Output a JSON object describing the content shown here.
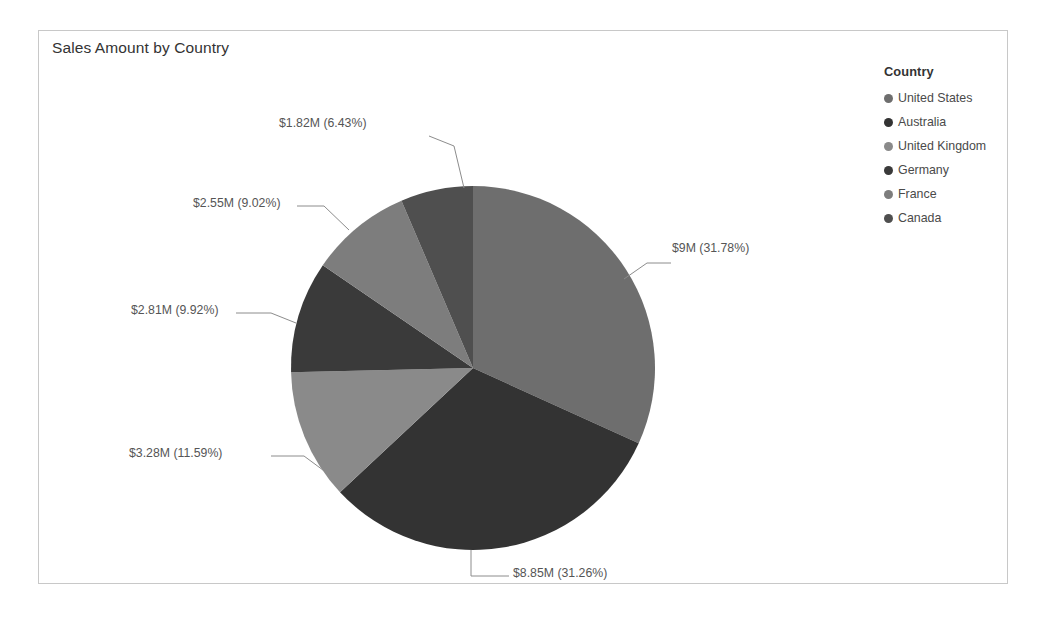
{
  "chart_card": {
    "title": "Sales Amount by Country",
    "border_color": "#c8c8c8",
    "background": "#ffffff"
  },
  "legend": {
    "title": "Country",
    "position": "right",
    "items": [
      {
        "label": "United States",
        "color": "#6e6e6e"
      },
      {
        "label": "Australia",
        "color": "#333333"
      },
      {
        "label": "United Kingdom",
        "color": "#8a8a8a"
      },
      {
        "label": "Germany",
        "color": "#3a3a3a"
      },
      {
        "label": "France",
        "color": "#7d7d7d"
      },
      {
        "label": "Canada",
        "color": "#4f4f4f"
      }
    ]
  },
  "chart_data": {
    "type": "pie",
    "title": "Sales Amount by Country",
    "xlabel": "",
    "ylabel": "",
    "categories": [
      "United States",
      "Australia",
      "United Kingdom",
      "Germany",
      "France",
      "Canada"
    ],
    "values": [
      9.0,
      8.85,
      3.28,
      2.81,
      2.55,
      1.82
    ],
    "value_unit": "millions USD",
    "percentages": [
      31.78,
      31.26,
      11.59,
      9.92,
      9.02,
      6.43
    ],
    "colors": [
      "#6e6e6e",
      "#333333",
      "#8a8a8a",
      "#3a3a3a",
      "#7d7d7d",
      "#4f4f4f"
    ],
    "data_labels": [
      "$9M (31.78%)",
      "$8.85M (31.26%)",
      "$3.28M (11.59%)",
      "$2.81M (9.92%)",
      "$2.55M (9.02%)",
      "$1.82M (6.43%)"
    ],
    "start_angle_deg": 0,
    "direction": "clockwise",
    "legend": [
      "United States",
      "Australia",
      "United Kingdom",
      "Germany",
      "France",
      "Canada"
    ],
    "legend_position": "right",
    "grid": false
  },
  "labels": {
    "united_states": "$9M (31.78%)",
    "australia": "$8.85M (31.26%)",
    "united_kingdom": "$3.28M (11.59%)",
    "germany": "$2.81M (9.92%)",
    "france": "$2.55M (9.02%)",
    "canada": "$1.82M (6.43%)"
  }
}
